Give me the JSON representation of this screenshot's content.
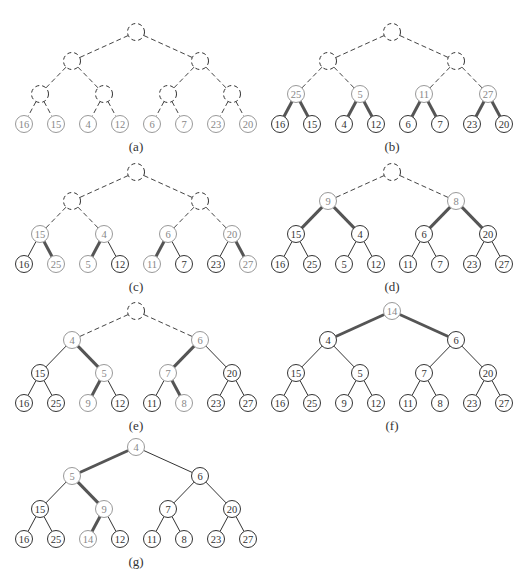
{
  "figure": {
    "colors": {
      "line": "#333333",
      "node_stroke": "#333333",
      "highlight_stroke": "#999999",
      "highlight_text": "#888888",
      "text": "#333333",
      "dashed": "#444444",
      "background": "#ffffff"
    },
    "panels": [
      {
        "label": "(a)",
        "offset": [
          0,
          0
        ],
        "nodes": [
          {
            "key": "",
            "style": "dashed"
          },
          {
            "key": "",
            "style": "dashed"
          },
          {
            "key": "",
            "style": "dashed"
          },
          {
            "key": "",
            "style": "dashed"
          },
          {
            "key": "",
            "style": "dashed"
          },
          {
            "key": "",
            "style": "dashed"
          },
          {
            "key": "",
            "style": "dashed"
          },
          {
            "key": "16",
            "style": "light"
          },
          {
            "key": "15",
            "style": "light"
          },
          {
            "key": "4",
            "style": "light"
          },
          {
            "key": "12",
            "style": "light"
          },
          {
            "key": "6",
            "style": "light"
          },
          {
            "key": "7",
            "style": "light"
          },
          {
            "key": "23",
            "style": "light"
          },
          {
            "key": "20",
            "style": "light"
          }
        ],
        "edges": {
          "1": "dashed",
          "2": "dashed",
          "3": "dashed",
          "4": "dashed",
          "5": "dashed",
          "6": "dashed",
          "7": "dashed",
          "8": "dashed",
          "9": "dashed",
          "10": "dashed",
          "11": "dashed",
          "12": "dashed",
          "13": "dashed",
          "14": "dashed"
        }
      },
      {
        "label": "(b)",
        "offset": [
          256,
          0
        ],
        "nodes": [
          {
            "key": "",
            "style": "dashed"
          },
          {
            "key": "",
            "style": "dashed"
          },
          {
            "key": "",
            "style": "dashed"
          },
          {
            "key": "25",
            "style": "light"
          },
          {
            "key": "5",
            "style": "light"
          },
          {
            "key": "11",
            "style": "light"
          },
          {
            "key": "27",
            "style": "light"
          },
          {
            "key": "16",
            "style": "normal"
          },
          {
            "key": "15",
            "style": "normal"
          },
          {
            "key": "4",
            "style": "normal"
          },
          {
            "key": "12",
            "style": "normal"
          },
          {
            "key": "6",
            "style": "normal"
          },
          {
            "key": "7",
            "style": "normal"
          },
          {
            "key": "23",
            "style": "normal"
          },
          {
            "key": "20",
            "style": "normal"
          }
        ],
        "edges": {
          "1": "dashed",
          "2": "dashed",
          "3": "dashed",
          "4": "dashed",
          "5": "dashed",
          "6": "dashed",
          "7": "bold",
          "8": "bold",
          "9": "bold",
          "10": "bold",
          "11": "bold",
          "12": "bold",
          "13": "bold",
          "14": "bold"
        }
      },
      {
        "label": "(c)",
        "offset": [
          0,
          140
        ],
        "nodes": [
          {
            "key": "",
            "style": "dashed"
          },
          {
            "key": "",
            "style": "dashed"
          },
          {
            "key": "",
            "style": "dashed"
          },
          {
            "key": "15",
            "style": "light"
          },
          {
            "key": "4",
            "style": "light"
          },
          {
            "key": "6",
            "style": "light"
          },
          {
            "key": "20",
            "style": "light"
          },
          {
            "key": "16",
            "style": "normal"
          },
          {
            "key": "25",
            "style": "light"
          },
          {
            "key": "5",
            "style": "light"
          },
          {
            "key": "12",
            "style": "normal"
          },
          {
            "key": "11",
            "style": "light"
          },
          {
            "key": "7",
            "style": "normal"
          },
          {
            "key": "23",
            "style": "normal"
          },
          {
            "key": "27",
            "style": "light"
          }
        ],
        "edges": {
          "1": "dashed",
          "2": "dashed",
          "3": "dashed",
          "4": "dashed",
          "5": "dashed",
          "6": "dashed",
          "7": "normal",
          "8": "bold",
          "9": "bold",
          "10": "normal",
          "11": "bold",
          "12": "normal",
          "13": "normal",
          "14": "bold"
        }
      },
      {
        "label": "(d)",
        "offset": [
          256,
          140
        ],
        "nodes": [
          {
            "key": "",
            "style": "dashed"
          },
          {
            "key": "9",
            "style": "light"
          },
          {
            "key": "8",
            "style": "light"
          },
          {
            "key": "15",
            "style": "normal"
          },
          {
            "key": "4",
            "style": "normal"
          },
          {
            "key": "6",
            "style": "normal"
          },
          {
            "key": "20",
            "style": "normal"
          },
          {
            "key": "16",
            "style": "normal"
          },
          {
            "key": "25",
            "style": "normal"
          },
          {
            "key": "5",
            "style": "normal"
          },
          {
            "key": "12",
            "style": "normal"
          },
          {
            "key": "11",
            "style": "normal"
          },
          {
            "key": "7",
            "style": "normal"
          },
          {
            "key": "23",
            "style": "normal"
          },
          {
            "key": "27",
            "style": "normal"
          }
        ],
        "edges": {
          "1": "dashed",
          "2": "dashed",
          "3": "bold",
          "4": "bold",
          "5": "bold",
          "6": "bold",
          "7": "normal",
          "8": "normal",
          "9": "normal",
          "10": "normal",
          "11": "normal",
          "12": "normal",
          "13": "normal",
          "14": "normal"
        }
      },
      {
        "label": "(e)",
        "offset": [
          0,
          279
        ],
        "nodes": [
          {
            "key": "",
            "style": "dashed"
          },
          {
            "key": "4",
            "style": "light"
          },
          {
            "key": "6",
            "style": "light"
          },
          {
            "key": "15",
            "style": "normal"
          },
          {
            "key": "5",
            "style": "light"
          },
          {
            "key": "7",
            "style": "light"
          },
          {
            "key": "20",
            "style": "normal"
          },
          {
            "key": "16",
            "style": "normal"
          },
          {
            "key": "25",
            "style": "normal"
          },
          {
            "key": "9",
            "style": "light"
          },
          {
            "key": "12",
            "style": "normal"
          },
          {
            "key": "11",
            "style": "normal"
          },
          {
            "key": "8",
            "style": "light"
          },
          {
            "key": "23",
            "style": "normal"
          },
          {
            "key": "27",
            "style": "normal"
          }
        ],
        "edges": {
          "1": "dashed",
          "2": "dashed",
          "3": "normal",
          "4": "bold",
          "5": "bold",
          "6": "normal",
          "7": "normal",
          "8": "normal",
          "9": "bold",
          "10": "normal",
          "11": "normal",
          "12": "bold",
          "13": "normal",
          "14": "normal"
        }
      },
      {
        "label": "(f)",
        "offset": [
          256,
          279
        ],
        "nodes": [
          {
            "key": "14",
            "style": "light"
          },
          {
            "key": "4",
            "style": "normal"
          },
          {
            "key": "6",
            "style": "normal"
          },
          {
            "key": "15",
            "style": "normal"
          },
          {
            "key": "5",
            "style": "normal"
          },
          {
            "key": "7",
            "style": "normal"
          },
          {
            "key": "20",
            "style": "normal"
          },
          {
            "key": "16",
            "style": "normal"
          },
          {
            "key": "25",
            "style": "normal"
          },
          {
            "key": "9",
            "style": "normal"
          },
          {
            "key": "12",
            "style": "normal"
          },
          {
            "key": "11",
            "style": "normal"
          },
          {
            "key": "8",
            "style": "normal"
          },
          {
            "key": "23",
            "style": "normal"
          },
          {
            "key": "27",
            "style": "normal"
          }
        ],
        "edges": {
          "1": "bold",
          "2": "bold",
          "3": "normal",
          "4": "normal",
          "5": "normal",
          "6": "normal",
          "7": "normal",
          "8": "normal",
          "9": "normal",
          "10": "normal",
          "11": "normal",
          "12": "normal",
          "13": "normal",
          "14": "normal"
        }
      },
      {
        "label": "(g)",
        "offset": [
          0,
          415
        ],
        "nodes": [
          {
            "key": "4",
            "style": "light"
          },
          {
            "key": "5",
            "style": "light"
          },
          {
            "key": "6",
            "style": "normal"
          },
          {
            "key": "15",
            "style": "normal"
          },
          {
            "key": "9",
            "style": "light"
          },
          {
            "key": "7",
            "style": "normal"
          },
          {
            "key": "20",
            "style": "normal"
          },
          {
            "key": "16",
            "style": "normal"
          },
          {
            "key": "25",
            "style": "normal"
          },
          {
            "key": "14",
            "style": "light"
          },
          {
            "key": "12",
            "style": "normal"
          },
          {
            "key": "11",
            "style": "normal"
          },
          {
            "key": "8",
            "style": "normal"
          },
          {
            "key": "23",
            "style": "normal"
          },
          {
            "key": "27",
            "style": "normal"
          }
        ],
        "edges": {
          "1": "bold",
          "2": "normal",
          "3": "normal",
          "4": "bold",
          "5": "normal",
          "6": "normal",
          "7": "normal",
          "8": "normal",
          "9": "bold",
          "10": "normal",
          "11": "normal",
          "12": "normal",
          "13": "normal",
          "14": "normal"
        }
      }
    ]
  }
}
